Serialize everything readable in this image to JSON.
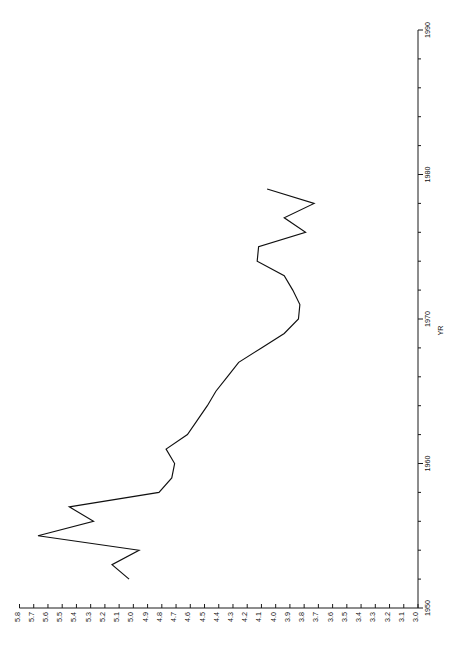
{
  "chart_data": {
    "type": "line",
    "title": "",
    "subtitle": "",
    "orientation": "rotated-90",
    "xlabel": "YR",
    "ylabel": "",
    "value_axis_label": "",
    "value_axis_position": "bottom",
    "value_axis_reversed": true,
    "time_axis_position": "right",
    "xlim": [
      1950,
      1990
    ],
    "ylim": [
      3.0,
      5.8
    ],
    "grid": false,
    "legend": null,
    "value_ticks": [
      "5.8",
      "5.7",
      "5.6",
      "5.5",
      "5.4",
      "5.3",
      "5.2",
      "5.1",
      "5.0",
      "4.9",
      "4.8",
      "4.7",
      "4.6",
      "4.5",
      "4.4",
      "4.3",
      "4.2",
      "4.1",
      "4.0",
      "3.9",
      "3.8",
      "3.7",
      "3.6",
      "3.5",
      "3.4",
      "3.3",
      "3.2",
      "3.1",
      "3.0"
    ],
    "value_tick_values": [
      5.8,
      5.7,
      5.6,
      5.5,
      5.4,
      5.3,
      5.2,
      5.1,
      5.0,
      4.9,
      4.8,
      4.7,
      4.6,
      4.5,
      4.4,
      4.3,
      4.2,
      4.1,
      4.0,
      3.9,
      3.8,
      3.7,
      3.6,
      3.5,
      3.4,
      3.3,
      3.2,
      3.1,
      3.0
    ],
    "time_major_ticks": [
      1950,
      1960,
      1970,
      1980,
      1990
    ],
    "time_major_tick_labels": [
      "1950",
      "1960",
      "1970",
      "1980",
      "1990"
    ],
    "time_minor_tick_interval": 2,
    "x": [
      1952,
      1953,
      1954,
      1955,
      1956,
      1957,
      1958,
      1959,
      1960,
      1961,
      1962,
      1963,
      1964,
      1965,
      1966,
      1967,
      1968,
      1969,
      1970,
      1971,
      1972,
      1973,
      1974,
      1975,
      1976,
      1977,
      1978,
      1979
    ],
    "values": [
      5.03,
      5.15,
      4.96,
      5.67,
      5.28,
      5.45,
      4.82,
      4.73,
      4.71,
      4.77,
      4.62,
      4.55,
      4.48,
      4.42,
      4.34,
      4.26,
      4.1,
      3.94,
      3.84,
      3.83,
      3.88,
      3.94,
      4.13,
      4.12,
      3.79,
      3.94,
      3.73,
      4.06
    ],
    "series_name": "YR",
    "marker": "none",
    "line_color": "#101010"
  },
  "axes": {
    "value_axis_name": "value-axis",
    "time_axis_name": "year-axis",
    "time_axis_title": "YR"
  }
}
